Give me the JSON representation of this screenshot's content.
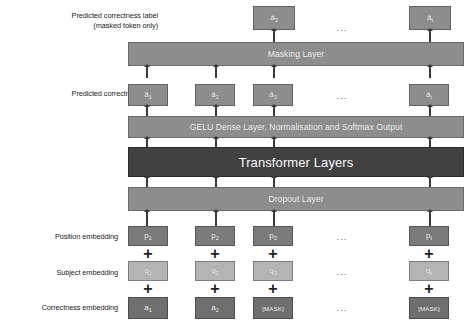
{
  "figure": {
    "type": "architecture-diagram"
  },
  "row_labels": {
    "masked_prediction": "Predicted correctness label\n(masked token only)",
    "prediction": "Predicted correctness label",
    "position": "Position embedding",
    "subject": "Subject embedding",
    "correctness": "Correctness embedding"
  },
  "layers": {
    "masking": "Masking Layer",
    "gelu": "GELU Dense Layer, Normalisation and Softmax Output",
    "transformer": "Transformer Layers",
    "dropout": "Dropout Layer"
  },
  "ellipsis": "...",
  "rows": {
    "masked_outputs": [
      {
        "base": "â",
        "sub": "3"
      },
      {
        "base": "â",
        "sub": "t"
      }
    ],
    "predicted_outputs": [
      {
        "base": "â",
        "sub": "1"
      },
      {
        "base": "â",
        "sub": "2"
      },
      {
        "base": "â",
        "sub": "3"
      },
      {
        "base": "â",
        "sub": "t"
      }
    ],
    "position_embeddings": [
      {
        "base": "p",
        "sub": "1"
      },
      {
        "base": "p",
        "sub": "2"
      },
      {
        "base": "p",
        "sub": "3"
      },
      {
        "base": "p",
        "sub": "t"
      }
    ],
    "subject_embeddings": [
      {
        "base": "q",
        "sub": "1"
      },
      {
        "base": "q",
        "sub": "2"
      },
      {
        "base": "q",
        "sub": "3"
      },
      {
        "base": "q",
        "sub": "t"
      }
    ],
    "correctness_embeddings": [
      {
        "base": "a",
        "sub": "1"
      },
      {
        "base": "a",
        "sub": "2"
      },
      {
        "base": "[MASK]",
        "sub": ""
      },
      {
        "base": "[MASK]",
        "sub": ""
      }
    ]
  },
  "operators": {
    "plus": "+"
  },
  "colors": {
    "layer_bar": "#8d8d8d",
    "transformer_bar": "#414141",
    "token_dark": "#7b7b7b",
    "token_light": "#b4b4b4",
    "background": "#ffffff",
    "arrow": "#3a3a3a",
    "text_on_bar": "#ffffff",
    "label_text": "#1c1c1c"
  }
}
